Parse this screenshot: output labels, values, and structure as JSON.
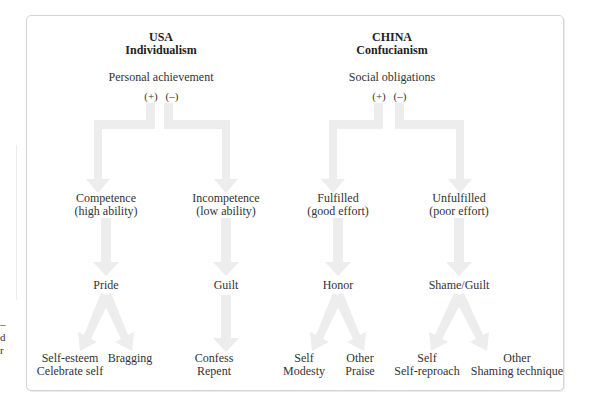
{
  "edge_fragments": [
    "–",
    "d",
    "r"
  ],
  "usa": {
    "country": "USA",
    "ideology": "Individualism",
    "root": "Personal achievement",
    "positive_sign": "(+)",
    "negative_sign": "(–)",
    "positive_branch": {
      "outcome_line1": "Competence",
      "outcome_line2": "(high ability)",
      "emotion": "Pride",
      "leaves": [
        {
          "line1": "Self-esteem",
          "line2": "Celebrate self"
        },
        {
          "line1": "Bragging",
          "line2": ""
        }
      ]
    },
    "negative_branch": {
      "outcome_line1": "Incompetence",
      "outcome_line2": "(low ability)",
      "emotion": "Guilt",
      "leaves": [
        {
          "line1": "Confess",
          "line2": "Repent"
        }
      ]
    }
  },
  "china": {
    "country": "CHINA",
    "ideology": "Confucianism",
    "root": "Social obligations",
    "positive_sign": "(+)",
    "negative_sign": "(–)",
    "positive_branch": {
      "outcome_line1": "Fulfilled",
      "outcome_line2": "(good effort)",
      "emotion": "Honor",
      "leaves": [
        {
          "line1": "Self",
          "line2": "Modesty"
        },
        {
          "line1": "Other",
          "line2": "Praise"
        }
      ]
    },
    "negative_branch": {
      "outcome_line1": "Unfulfilled",
      "outcome_line2": "(poor effort)",
      "emotion": "Shame/Guilt",
      "leaves": [
        {
          "line1": "Self",
          "line2": "Self-reproach"
        },
        {
          "line1": "Other",
          "line2": "Shaming technique"
        }
      ]
    }
  },
  "colors": {
    "arrow_fill": "#ededed",
    "frame_border": "#d4d4d4",
    "text": "#333333"
  }
}
